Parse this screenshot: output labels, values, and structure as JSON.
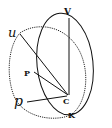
{
  "diagram": {
    "type": "geometric-sphere-projection",
    "stroke_color": "#111111",
    "background": "#ffffff",
    "labels": {
      "V": "V",
      "u": "u",
      "P": "P",
      "C": "C",
      "p": "p",
      "K": "K"
    },
    "points": {
      "V": [
        69,
        12
      ],
      "u": [
        13,
        33
      ],
      "P": [
        30,
        72
      ],
      "C": [
        69,
        94
      ],
      "p": [
        14,
        104
      ],
      "K": [
        72,
        113
      ]
    },
    "shapes": [
      {
        "kind": "ellipse",
        "name": "meridian-circle",
        "style": "solid",
        "cx": 64,
        "cy": 64,
        "rx": 29,
        "ry": 51,
        "rotate": -6
      },
      {
        "kind": "ellipse",
        "name": "oblique-circle",
        "style": "dotted",
        "cx": 45,
        "cy": 76,
        "rx": 37,
        "ry": 42,
        "rotate": 0
      },
      {
        "kind": "line",
        "name": "line-VC",
        "from": "V",
        "to": "C"
      },
      {
        "kind": "line",
        "name": "line-uC",
        "from": "u",
        "to": "C"
      },
      {
        "kind": "line",
        "name": "line-PC",
        "from": "P",
        "to": "C"
      },
      {
        "kind": "line",
        "name": "line-pC",
        "from": "p",
        "to": "C"
      }
    ]
  }
}
